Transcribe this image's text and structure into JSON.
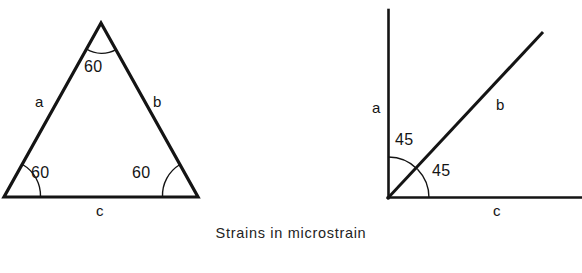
{
  "figure": {
    "caption": "Strains in microstrain",
    "line_color": "#141414",
    "background_color": "#ffffff",
    "diagrams": [
      {
        "name": "equilateral-rosette",
        "shape": "triangle",
        "side_labels": {
          "a": "a",
          "b": "b",
          "c": "c"
        },
        "angles": [
          {
            "position": "apex",
            "value": "60"
          },
          {
            "position": "bottom-left",
            "value": "60"
          },
          {
            "position": "bottom-right",
            "value": "60"
          }
        ],
        "vertices": {
          "apex": [
            101,
            23
          ],
          "bottom_left": [
            4,
            197
          ],
          "bottom_right": [
            198,
            197
          ]
        }
      },
      {
        "name": "rectangular-rosette",
        "shape": "right-angle-axes",
        "side_labels": {
          "a": "a",
          "b": "b",
          "c": "c"
        },
        "angles": [
          {
            "position": "upper",
            "value": "45"
          },
          {
            "position": "lower",
            "value": "45"
          }
        ],
        "origin": [
          388,
          198
        ],
        "vertical_top": [
          388,
          10
        ],
        "diagonal_end": [
          542,
          33
        ],
        "horizontal_end": [
          582,
          198
        ]
      }
    ]
  },
  "labels": {
    "tri_a": "a",
    "tri_b": "b",
    "tri_c": "c",
    "tri_angle_top": "60",
    "tri_angle_left": "60",
    "tri_angle_right": "60",
    "rect_a": "a",
    "rect_b": "b",
    "rect_c": "c",
    "rect_angle_upper": "45",
    "rect_angle_lower": "45"
  }
}
